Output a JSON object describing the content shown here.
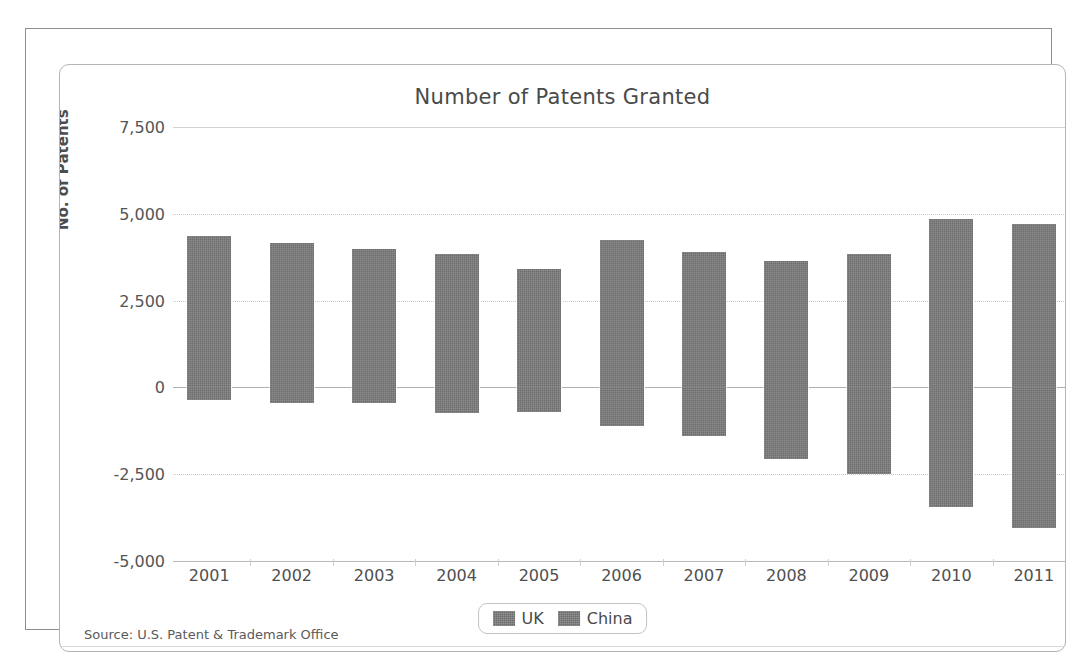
{
  "chart_data": {
    "type": "bar",
    "title": "Number of Patents Granted",
    "xlabel": "",
    "ylabel": "No. of Patents",
    "categories": [
      "2001",
      "2002",
      "2003",
      "2004",
      "2005",
      "2006",
      "2007",
      "2008",
      "2009",
      "2010",
      "2011"
    ],
    "series": [
      {
        "name": "UK",
        "values": [
          4350,
          4150,
          4000,
          3850,
          3400,
          4250,
          3900,
          3650,
          3850,
          4850,
          4700
        ]
      },
      {
        "name": "China",
        "values": [
          -350,
          -450,
          -450,
          -750,
          -700,
          -1100,
          -1400,
          -2050,
          -2500,
          -3450,
          -4050
        ]
      }
    ],
    "yticks": [
      7500,
      5000,
      2500,
      0,
      -2500,
      -5000
    ],
    "ytick_labels": [
      "7,500",
      "5,000",
      "2,500",
      "0",
      "-2,500",
      "-5,000"
    ],
    "ylim": [
      -5000,
      7500
    ],
    "grid": true,
    "legend_position": "bottom-center",
    "bar_color": "#6e6e6e",
    "source": "Source: U.S. Patent & Trademark Office"
  },
  "legend": {
    "items": [
      {
        "label": "UK",
        "color": "#6e6e6e"
      },
      {
        "label": "China",
        "color": "#6e6e6e"
      }
    ]
  },
  "footer": {
    "source": "Source: U.S. Patent & Trademark Office"
  }
}
